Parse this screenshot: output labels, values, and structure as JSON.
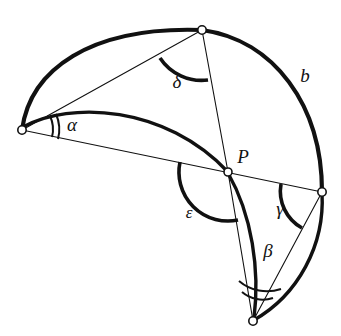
{
  "figure": {
    "background_color": "#ffffff",
    "stroke_color": "#111111",
    "width": 341,
    "height": 336
  },
  "labels": {
    "alpha": "α",
    "beta": "β",
    "gamma": "γ",
    "delta": "δ",
    "epsilon": "ε",
    "side_b": "b",
    "point_p": "P"
  },
  "label_positions": {
    "alpha": {
      "x": 72,
      "y": 127
    },
    "beta": {
      "x": 268,
      "y": 253
    },
    "gamma": {
      "x": 280,
      "y": 211
    },
    "delta": {
      "x": 177,
      "y": 84
    },
    "epsilon": {
      "x": 189,
      "y": 214
    },
    "side_b": {
      "x": 305,
      "y": 78
    },
    "point_p": {
      "x": 243,
      "y": 159
    }
  },
  "vertices": [
    {
      "name": "left-vertex",
      "x": 22,
      "y": 130
    },
    {
      "name": "top-vertex",
      "x": 202,
      "y": 30
    },
    {
      "name": "point-p",
      "x": 228,
      "y": 172
    },
    {
      "name": "right-vertex",
      "x": 322,
      "y": 192
    },
    {
      "name": "bottom-vertex",
      "x": 253,
      "y": 321
    }
  ],
  "angle_markers": [
    {
      "name": "alpha",
      "vertex": "left-vertex",
      "arcs": 2,
      "weight": "thin"
    },
    {
      "name": "beta",
      "vertex": "bottom-vertex",
      "arcs": 2,
      "weight": "thin"
    },
    {
      "name": "gamma",
      "vertex": "right-vertex",
      "arcs": 1,
      "weight": "thick"
    },
    {
      "name": "delta",
      "vertex": "top-vertex",
      "arcs": 1,
      "weight": "thick"
    },
    {
      "name": "epsilon",
      "vertex": "point-p",
      "arcs": 1,
      "weight": "thick"
    }
  ],
  "edges": [
    {
      "name": "arc-left-to-top",
      "kind": "thick-arc"
    },
    {
      "name": "chord-left-to-top",
      "kind": "thin-line"
    },
    {
      "name": "arc-left-to-p",
      "kind": "thick-arc"
    },
    {
      "name": "line-left-through-p-to-right",
      "kind": "thin-line"
    },
    {
      "name": "line-top-to-p-to-bottom",
      "kind": "thin-line"
    },
    {
      "name": "arc-b-top-to-right",
      "kind": "thick-arc"
    },
    {
      "name": "arc-p-to-bottom",
      "kind": "thick-arc"
    },
    {
      "name": "line-right-to-bottom",
      "kind": "thin-line"
    },
    {
      "name": "arc-right-to-bottom",
      "kind": "thick-arc"
    }
  ]
}
